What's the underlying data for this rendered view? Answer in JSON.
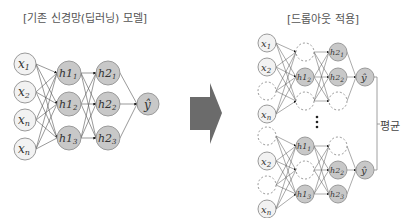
{
  "titles": {
    "left": "[기존 신경망(딥러닝) 모델]",
    "right": "[드롭아웃 적용]"
  },
  "labels": {
    "average": "평균"
  },
  "colors": {
    "input_fill": "#f2f2f2",
    "hidden_fill": "#c8c8c8",
    "stroke": "#9a9a9a",
    "edge": "#555555",
    "arrow": "#6b6b6b",
    "dropped": "#999999"
  },
  "left_network": {
    "inputs": [
      "x1",
      "x2",
      "xn",
      "xn"
    ],
    "hidden1": [
      "h1_1",
      "h1_2",
      "h1_3"
    ],
    "hidden2": [
      "h2_1",
      "h2_2",
      "h2_3"
    ],
    "output": "ŷ"
  },
  "right_network": {
    "subnet_top": {
      "inputs": [
        "x1",
        "x2",
        "(dropped)",
        "xn"
      ],
      "hidden1": [
        "(dropped)",
        "h1_2",
        "(dropped)"
      ],
      "hidden2": [
        "h2_1",
        "h2_2",
        "(dropped)"
      ],
      "output": "ŷ"
    },
    "subnet_bottom": {
      "inputs": [
        "(dropped)",
        "x2",
        "(dropped)",
        "xn"
      ],
      "hidden1": [
        "h1_1",
        "(dropped)",
        "h1_3"
      ],
      "hidden2": [
        "(dropped)",
        "h2_2",
        "h2_3"
      ],
      "output": "ŷ"
    },
    "ellipsis": "⋮"
  }
}
